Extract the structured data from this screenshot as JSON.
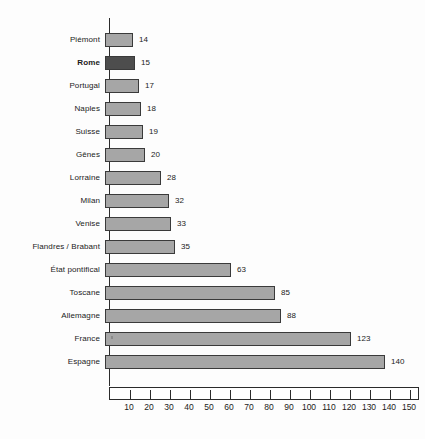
{
  "chart_data": {
    "type": "bar",
    "orientation": "horizontal",
    "title": "",
    "subtitle": "",
    "xlabel": "",
    "ylabel": "",
    "categories": [
      "Piémont",
      "Rome",
      "Portugal",
      "Naples",
      "Suisse",
      "Gênes",
      "Lorraine",
      "Milan",
      "Venise",
      "Flandres / Brabant",
      "État pontifical",
      "Toscane",
      "Allemagne",
      "France",
      "Espagne"
    ],
    "values": [
      14,
      15,
      17,
      18,
      19,
      20,
      28,
      32,
      33,
      35,
      63,
      85,
      88,
      123,
      140
    ],
    "highlight_category": "Rome",
    "highlighted_index": 1,
    "bar_color": "#a6a6a6",
    "highlight_color": "#4d4d4d",
    "bar_border_color": "#3a3a3a",
    "axis_color": "#2b2b2b",
    "background_color": "#fdfdfd",
    "xlim": [
      0,
      150
    ],
    "xticks": [
      10,
      20,
      30,
      40,
      50,
      60,
      70,
      80,
      90,
      100,
      110,
      120,
      130,
      140,
      150
    ],
    "xtick_labels": [
      "10",
      "20",
      "30",
      "40",
      "50",
      "60",
      "70",
      "80",
      "90",
      "100",
      "110",
      "120",
      "130",
      "140",
      "150"
    ],
    "data_labels": [
      "14",
      "15",
      "17",
      "18",
      "19",
      "20",
      "28",
      "32",
      "33",
      "35",
      "63",
      "85",
      "88",
      "123",
      "140"
    ],
    "grid": false,
    "legend": false
  }
}
